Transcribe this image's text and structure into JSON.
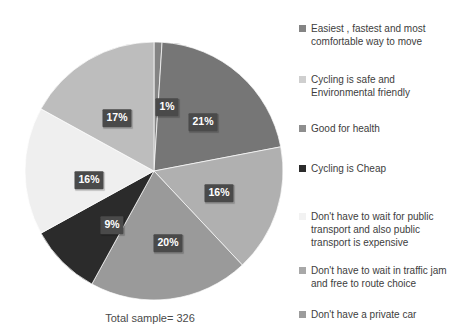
{
  "caption": "Total sample= 326",
  "chart_data": {
    "type": "pie",
    "title": "",
    "total_sample": 326,
    "legend_position": "right",
    "start_angle_deg": 0,
    "direction": "clockwise",
    "categories": [
      "Easiest , fastest and most comfortable way to move",
      "Cycling is safe and Environmental friendly",
      "Good for health",
      "Cycling is Cheap",
      "Don't have to wait for public transport and also public transport is expensive",
      "Don't have to wait in traffic jam and free to route choice",
      "Don't have a private car"
    ],
    "values": [
      1,
      21,
      16,
      20,
      9,
      16,
      17
    ],
    "value_labels": [
      "1%",
      "21%",
      "16%",
      "20%",
      "9%",
      "16%",
      "17%"
    ],
    "colors": [
      "#848484",
      "#767676",
      "#b0b0b0",
      "#9a9a9a",
      "#2b2b2b",
      "#efefef",
      "#bdbdbd"
    ]
  },
  "legend": {
    "items": [
      {
        "label": "Easiest , fastest and most comfortable way to move",
        "color": "#848484"
      },
      {
        "label": "Cycling is safe and Environmental friendly",
        "color": "#cfcfcf"
      },
      {
        "label": "Good for health",
        "color": "#8e8e8e"
      },
      {
        "label": "Cycling is Cheap",
        "color": "#2b2b2b"
      },
      {
        "label": "Don't have to wait for public transport and also public transport is expensive",
        "color": "#f2f2f2"
      },
      {
        "label": "Don't have to wait in traffic jam and free to route choice",
        "color": "#a8a8a8"
      },
      {
        "label": "Don't have a private car",
        "color": "#9c9c9c"
      }
    ]
  },
  "slice_labels": [
    {
      "text": "1%",
      "x": 167,
      "y": 107
    },
    {
      "text": "21%",
      "x": 203,
      "y": 122
    },
    {
      "text": "16%",
      "x": 219,
      "y": 193
    },
    {
      "text": "20%",
      "x": 168,
      "y": 243
    },
    {
      "text": "9%",
      "x": 112,
      "y": 225
    },
    {
      "text": "16%",
      "x": 89,
      "y": 180
    },
    {
      "text": "17%",
      "x": 117,
      "y": 118
    }
  ]
}
